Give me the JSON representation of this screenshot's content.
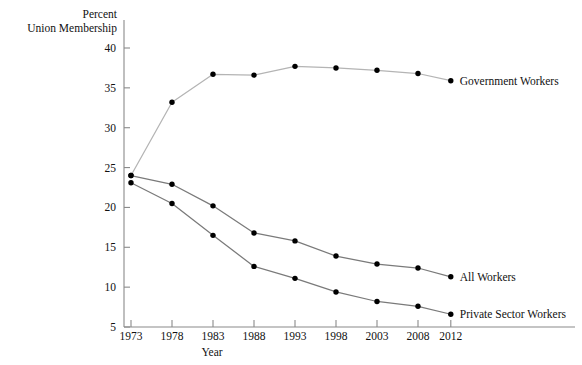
{
  "chart_data": {
    "type": "line",
    "title": "",
    "ylabel": "Percent Union Membership",
    "ylabel_line1": "Percent",
    "ylabel_line2": "Union Membership",
    "xlabel": "Year",
    "x": [
      1973,
      1978,
      1983,
      1988,
      1993,
      1998,
      2003,
      2008,
      2012
    ],
    "xtick_labels": [
      "1973",
      "1978",
      "1983",
      "1988",
      "1993",
      "1998",
      "2003",
      "2008",
      "2012"
    ],
    "ytick_labels": [
      "5",
      "10",
      "15",
      "20",
      "25",
      "30",
      "35",
      "40"
    ],
    "yticks": [
      5,
      10,
      15,
      20,
      25,
      30,
      35,
      40
    ],
    "xlim": [
      1971,
      2014
    ],
    "ylim": [
      5,
      41
    ],
    "grid": false,
    "legend_position": "right-inline-end-of-line",
    "series": [
      {
        "name": "Government Workers",
        "label": "Government Workers",
        "color": "#b4b4b4",
        "marker_color": "#000000",
        "values": [
          24.0,
          33.2,
          36.7,
          36.6,
          37.7,
          37.5,
          37.2,
          36.8,
          35.9
        ]
      },
      {
        "name": "All Workers",
        "label": "All Workers",
        "color": "#7a7a7a",
        "marker_color": "#000000",
        "values": [
          24.0,
          22.9,
          20.2,
          16.8,
          15.8,
          13.9,
          12.9,
          12.4,
          11.3
        ]
      },
      {
        "name": "Private Sector Workers",
        "label": "Private Sector Workers",
        "color": "#7a7a7a",
        "marker_color": "#000000",
        "values": [
          23.1,
          20.5,
          16.5,
          12.6,
          11.1,
          9.4,
          8.2,
          7.6,
          6.6
        ]
      }
    ]
  },
  "axes": {
    "y_title_line1": "Percent",
    "y_title_line2": "Union Membership",
    "x_title": "Year"
  },
  "colors": {
    "axis": "#8a8a8a",
    "text": "#111111",
    "line_light": "#b4b4b4",
    "line_dark": "#7a7a7a",
    "marker": "#000000",
    "background": "#ffffff"
  },
  "bottom_bleed_text": ""
}
